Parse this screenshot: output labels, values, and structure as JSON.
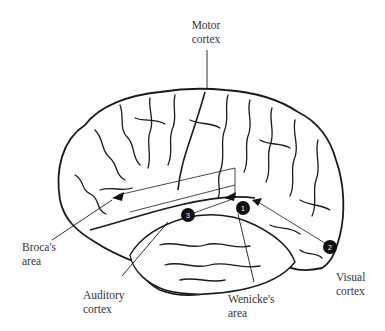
{
  "diagram": {
    "labels": {
      "motor": {
        "line1": "Motor",
        "line2": "cortex"
      },
      "broca": {
        "line1": "Broca's",
        "line2": "area"
      },
      "auditory": {
        "line1": "Auditory",
        "line2": "cortex"
      },
      "wernicke": {
        "line1": "Wenicke's",
        "line2": "area"
      },
      "visual": {
        "line1": "Visual",
        "line2": "cortex"
      }
    },
    "markers": [
      {
        "number": "1",
        "x": 243,
        "y": 208
      },
      {
        "number": "2",
        "x": 330,
        "y": 247
      },
      {
        "number": "3",
        "x": 188,
        "y": 215
      }
    ],
    "colors": {
      "ink": "#1a1a1a",
      "marker_fill": "#111111",
      "marker_text": "#ffffff"
    }
  }
}
